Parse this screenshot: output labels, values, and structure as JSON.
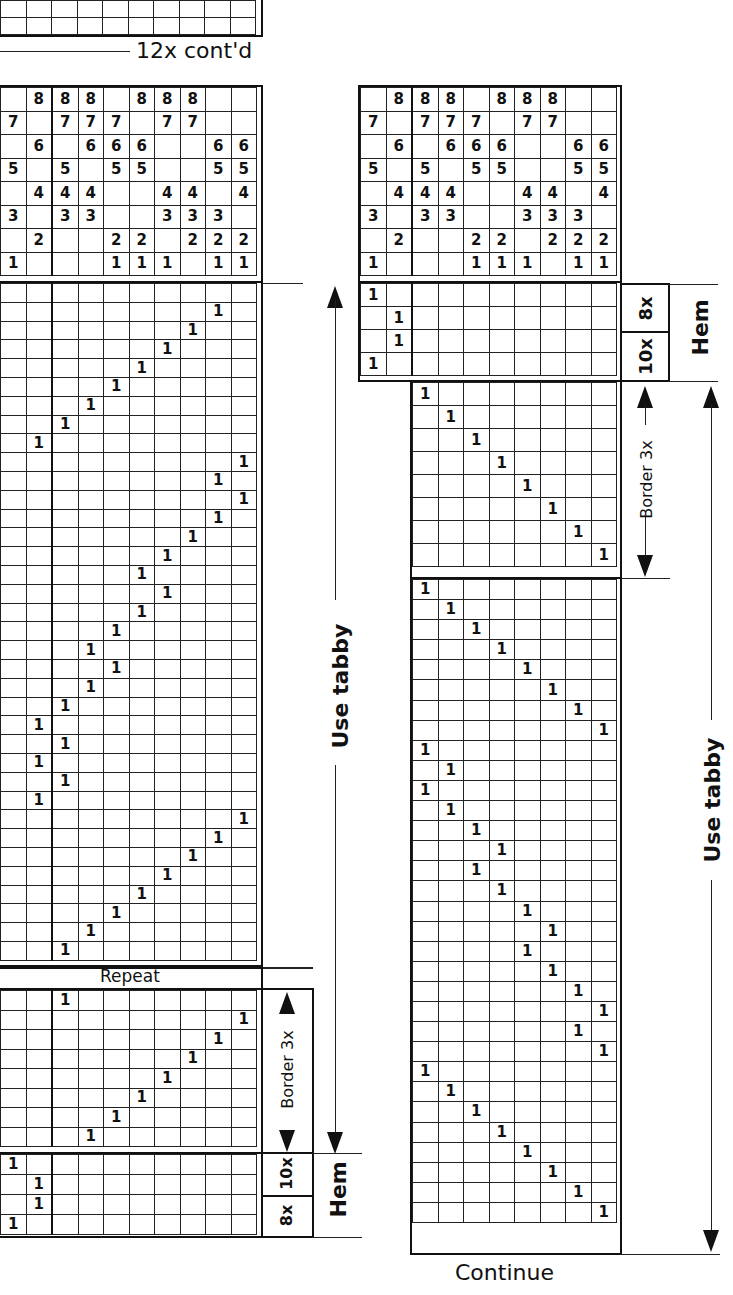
{
  "top_fragment": {
    "caption": "12x cont'd",
    "rows": 2,
    "cols": 10
  },
  "left_draft": {
    "threading": {
      "cols": 10,
      "rows": [
        [
          "",
          "8",
          "8",
          "8",
          "",
          "8",
          "8",
          "8",
          "",
          ""
        ],
        [
          "7",
          "",
          "7",
          "7",
          "7",
          "",
          "7",
          "7",
          "",
          ""
        ],
        [
          "",
          "6",
          "",
          "6",
          "6",
          "6",
          "",
          "",
          "6",
          "6"
        ],
        [
          "5",
          "",
          "5",
          "",
          "5",
          "5",
          "",
          "",
          "5",
          "5"
        ],
        [
          "",
          "4",
          "4",
          "4",
          "",
          "",
          "4",
          "4",
          "",
          "4"
        ],
        [
          "3",
          "",
          "3",
          "3",
          "",
          "",
          "3",
          "3",
          "3",
          ""
        ],
        [
          "",
          "2",
          "",
          "",
          "2",
          "2",
          "",
          "2",
          "2",
          "2"
        ],
        [
          "1",
          "",
          "",
          "",
          "1",
          "1",
          "1",
          "",
          "1",
          "1"
        ]
      ]
    },
    "tabby_section": {
      "label": "Use tabby",
      "marks_col_index": [
        null,
        9,
        8,
        7,
        6,
        5,
        4,
        3,
        2,
        10,
        9,
        10,
        9,
        8,
        7,
        6,
        7,
        6,
        5,
        4,
        5,
        4,
        3,
        2,
        3,
        2,
        3,
        2,
        10,
        9,
        8,
        7,
        6,
        5,
        4,
        3
      ]
    },
    "repeat_label": "Repeat",
    "border_section": {
      "label": "Border 3x",
      "marks_col_index": [
        3,
        10,
        9,
        8,
        7,
        6,
        5,
        4
      ]
    },
    "hem_section": {
      "label": "Hem",
      "sub_labels": [
        "10x",
        "8x"
      ],
      "marks_col_index": [
        1,
        2,
        2,
        1
      ]
    }
  },
  "right_draft": {
    "threading": {
      "cols": 10,
      "rows": [
        [
          "",
          "8",
          "8",
          "8",
          "",
          "8",
          "8",
          "8",
          "",
          ""
        ],
        [
          "7",
          "",
          "7",
          "7",
          "7",
          "",
          "7",
          "7",
          "",
          ""
        ],
        [
          "",
          "6",
          "",
          "6",
          "6",
          "6",
          "",
          "",
          "6",
          "6"
        ],
        [
          "5",
          "",
          "5",
          "",
          "5",
          "5",
          "",
          "",
          "5",
          "5"
        ],
        [
          "",
          "4",
          "4",
          "4",
          "",
          "",
          "4",
          "4",
          "",
          "4"
        ],
        [
          "3",
          "",
          "3",
          "3",
          "",
          "",
          "3",
          "3",
          "3",
          ""
        ],
        [
          "",
          "2",
          "",
          "",
          "2",
          "2",
          "",
          "2",
          "2",
          "2"
        ],
        [
          "1",
          "",
          "",
          "",
          "1",
          "1",
          "1",
          "",
          "1",
          "1"
        ]
      ]
    },
    "hem_section": {
      "label": "Hem",
      "sub_labels": [
        "8x",
        "10x"
      ],
      "marks_col_index": [
        1,
        2,
        2,
        1
      ]
    },
    "border_section": {
      "label": "Border 3x",
      "marks_col_index": [
        3,
        4,
        5,
        6,
        7,
        8,
        9,
        10
      ]
    },
    "tabby_section": {
      "label": "Use tabby",
      "marks_col_index": [
        3,
        4,
        5,
        6,
        7,
        8,
        9,
        10,
        3,
        4,
        3,
        4,
        5,
        6,
        5,
        6,
        7,
        8,
        7,
        8,
        9,
        10,
        9,
        10,
        3,
        4,
        5,
        6,
        7,
        8,
        9,
        10
      ]
    },
    "continue_label": "Continue"
  }
}
